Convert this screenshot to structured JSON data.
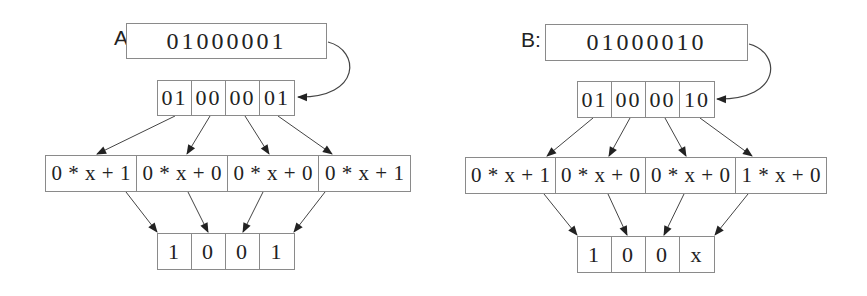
{
  "diagrams": {
    "a": {
      "label": "A:",
      "byte": "01000001",
      "split": [
        "01",
        "00",
        "00",
        "01"
      ],
      "formulas": [
        "0 * x + 1",
        "0 * x + 0",
        "0 * x + 0",
        "0 * x + 1"
      ],
      "result": [
        "1",
        "0",
        "0",
        "1"
      ]
    },
    "b": {
      "label": "B:",
      "byte": "01000010",
      "split": [
        "01",
        "00",
        "00",
        "10"
      ],
      "formulas": [
        "0 * x + 1",
        "0 * x + 0",
        "0 * x + 0",
        "1 * x + 0"
      ],
      "result": [
        "1",
        "0",
        "0",
        "x"
      ]
    }
  },
  "colors": {
    "border": "#8a8a8a",
    "arrow": "#222222",
    "text": "#222222"
  }
}
